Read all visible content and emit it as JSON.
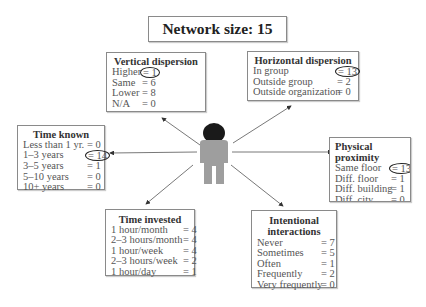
{
  "title": "Network size: 15",
  "colors": {
    "border": "#8a8a8a",
    "person_body": "#9e9e9e",
    "person_head": "#1a1a1a",
    "arrow": "#333333"
  },
  "center_icon": "person-icon",
  "boxes": {
    "vertical": {
      "heading": "Vertical dispersion",
      "rows": [
        {
          "label": "Higher",
          "value": "= 1",
          "circled": true
        },
        {
          "label": "Same",
          "value": "= 6"
        },
        {
          "label": "Lower",
          "value": "= 8"
        },
        {
          "label": "N/A",
          "value": "= 0"
        }
      ]
    },
    "horizontal": {
      "heading": "Horizontal dispersion",
      "rows": [
        {
          "label": "In group",
          "value": "= 13",
          "circled": true
        },
        {
          "label": "Outside group",
          "value": "= 2"
        },
        {
          "label": "Outside organization",
          "value": "= 0"
        }
      ]
    },
    "time_known": {
      "heading": "Time known",
      "rows": [
        {
          "label": "Less than 1 yr.",
          "value": "= 0"
        },
        {
          "label": "1–3 years",
          "value": "= 14",
          "circled": true
        },
        {
          "label": "3–5 years",
          "value": "= 1"
        },
        {
          "label": "5–10 years",
          "value": "= 0"
        },
        {
          "label": "10+ years",
          "value": "= 0"
        }
      ]
    },
    "physical": {
      "heading": "Physical proximity",
      "rows": [
        {
          "label": "Same floor",
          "value": "= 13",
          "circled": true
        },
        {
          "label": "Diff. floor",
          "value": "= 1"
        },
        {
          "label": "Diff. building",
          "value": "= 1"
        },
        {
          "label": "Diff. city",
          "value": "= 0"
        },
        {
          "label": "Diff. country",
          "value": "= 0"
        }
      ]
    },
    "time_invested": {
      "heading": "Time invested",
      "rows": [
        {
          "label": "1 hour/month",
          "value": "= 4"
        },
        {
          "label": "2–3 hours/month",
          "value": "= 4"
        },
        {
          "label": "1 hour/week",
          "value": "= 4"
        },
        {
          "label": "2–3 hours/week",
          "value": "= 2"
        },
        {
          "label": "1 hour/day",
          "value": "= 1"
        }
      ]
    },
    "intentional": {
      "heading": "Intentional interactions",
      "heading_line1": "Intentional",
      "heading_line2": "interactions",
      "rows": [
        {
          "label": "Never",
          "value": "= 7"
        },
        {
          "label": "Sometimes",
          "value": "= 5"
        },
        {
          "label": "Often",
          "value": "= 1"
        },
        {
          "label": "Frequently",
          "value": "= 2"
        },
        {
          "label": "Very frequently",
          "value": "= 0"
        }
      ]
    }
  }
}
